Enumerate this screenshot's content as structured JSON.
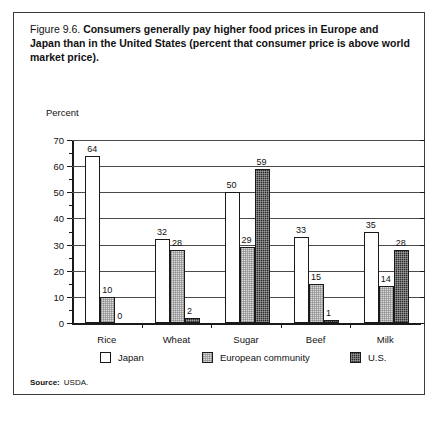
{
  "figure": {
    "number": "Figure 9.6.",
    "title": "Consumers generally pay higher food prices in Europe and Japan than in the United States (percent that consumer price is above world market price).",
    "axis_unit_label": "Percent",
    "source_label": "Source:",
    "source_value": "USDA."
  },
  "chart_data": {
    "type": "bar",
    "title": "Consumers generally pay higher food prices in Europe and Japan than in the United States (percent that consumer price is above world market price).",
    "xlabel": "",
    "ylabel": "Percent",
    "ylim": [
      0,
      70
    ],
    "ytick_step": 10,
    "yticks": [
      0,
      10,
      20,
      30,
      40,
      50,
      60,
      70
    ],
    "ytick_labels": [
      "0",
      "10",
      "20",
      "30",
      "40",
      "50",
      "60",
      "70"
    ],
    "minor_tick_step": 5,
    "grid": true,
    "legend_position": "bottom",
    "categories": [
      "Rice",
      "Wheat",
      "Sugar",
      "Beef",
      "Milk"
    ],
    "series": [
      {
        "name": "Japan",
        "color": "#ffffff",
        "values": [
          64,
          32,
          50,
          33,
          35
        ],
        "labels": [
          "64",
          "32",
          "50",
          "33",
          "35"
        ]
      },
      {
        "name": "European community",
        "color": "#dcdcdc",
        "values": [
          10,
          28,
          29,
          15,
          14
        ],
        "labels": [
          "10",
          "28",
          "29",
          "15",
          "14"
        ]
      },
      {
        "name": "U.S.",
        "color": "#2e2e2e",
        "values": [
          0,
          2,
          59,
          1,
          28
        ],
        "labels": [
          "0",
          "2",
          "59",
          "1",
          "28"
        ]
      }
    ]
  }
}
